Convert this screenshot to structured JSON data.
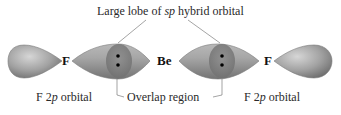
{
  "diagram": {
    "title_label": {
      "prefix": "Large lobe of ",
      "italic": "sp",
      "suffix": " hybrid orbital"
    },
    "atoms": [
      {
        "symbol": "F"
      },
      {
        "symbol": "Be"
      },
      {
        "symbol": "F"
      }
    ],
    "bottom_labels": {
      "left": {
        "prefix": "F 2",
        "italic": "p",
        "suffix": " orbital"
      },
      "center": "Overlap region",
      "right": {
        "prefix": "F 2",
        "italic": "p",
        "suffix": " orbital"
      }
    },
    "colors": {
      "orbital_fill": "#9a9a9a",
      "orbital_highlight": "#d0d0d0",
      "orbital_shadow": "#6e6e6e",
      "overlap_fill": "#7f7f7f",
      "electron": "#000000",
      "leader_line": "#555555"
    },
    "electron_pairs": 2
  }
}
